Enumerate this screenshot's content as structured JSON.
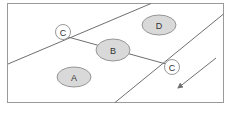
{
  "diagram": {
    "frame": {
      "x": 7,
      "y": 3,
      "width": 217,
      "height": 100
    },
    "colors": {
      "zone_fill": "#d9d9d9",
      "stroke": "#8c8c8c",
      "line": "#6f6f6f",
      "text": "#333333"
    },
    "boundaries": [
      {
        "id": "upper-diagonal",
        "x1": 8,
        "y1": 64,
        "x2": 151,
        "y2": 3
      },
      {
        "id": "lower-diagonal",
        "x1": 224,
        "y1": 14,
        "x2": 115,
        "y2": 103
      }
    ],
    "connector": {
      "from": "C-left",
      "to": "C-right",
      "x1": 68,
      "y1": 37,
      "x2": 167,
      "y2": 63
    },
    "zones": [
      {
        "id": "A",
        "label": "A",
        "cx": 74,
        "cy": 77,
        "rx": 17,
        "ry": 10
      },
      {
        "id": "B",
        "label": "B",
        "cx": 113,
        "cy": 50,
        "rx": 17,
        "ry": 11
      },
      {
        "id": "D",
        "label": "D",
        "cx": 159,
        "cy": 25,
        "rx": 17,
        "ry": 10
      }
    ],
    "nodes": [
      {
        "id": "C-left",
        "label": "C",
        "cx": 63,
        "cy": 32,
        "r": 7.5
      },
      {
        "id": "C-right",
        "label": "C",
        "cx": 172,
        "cy": 67,
        "r": 7.5
      }
    ],
    "arrow": {
      "x1": 216,
      "y1": 58,
      "x2": 177,
      "y2": 89,
      "direction": "down-left"
    }
  }
}
